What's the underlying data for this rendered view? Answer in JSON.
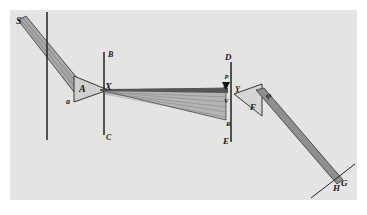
{
  "figure": {
    "labels": {
      "S": "S",
      "A": "A",
      "a": "a",
      "X": "X",
      "B": "B",
      "C": "C",
      "D": "D",
      "E": "E",
      "p": "p",
      "P": "P",
      "Y": "Y",
      "V": "V",
      "R": "R",
      "F": "F",
      "phi": "φ",
      "H": "H",
      "G": "G"
    },
    "colors": {
      "background": "#ffffff",
      "plate": "#e4e4e2",
      "ink": "#1a1a1a",
      "beam_fill": "#a8a8a6"
    }
  }
}
